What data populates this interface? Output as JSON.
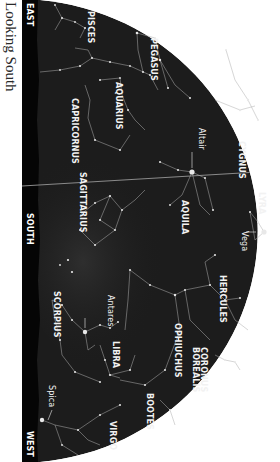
{
  "title": "Looking South",
  "colors": {
    "sky": "#1c1c1c",
    "horizon": "#050505",
    "lines": "#b9b9b9",
    "stars": "#e8e8e8",
    "labels": "#f2f2f2",
    "background": "#ffffff"
  },
  "directions": {
    "east": "EAST",
    "south": "SOUTH",
    "west": "WEST"
  },
  "constellations": {
    "pisces": "PISCES",
    "pegasus": "PEGASUS",
    "aquarius": "AQUARIUS",
    "capricornus": "CAPRICORNUS",
    "cygnus": "CYGNUS",
    "aquila": "AQUILA",
    "lyra": "LYRA",
    "sagittarius": "SAGITTARIUS",
    "hercules": "HERCULES",
    "ophiuchus": "OPHIUCHUS",
    "corona_line1": "CORONUS",
    "corona_line2": "BOREALIS",
    "scorpius": "SCORPIUS",
    "libra": "LIBRA",
    "bootes": "BOOTES",
    "virgo": "VIRGO"
  },
  "stars": {
    "altair": "Altair",
    "vega": "Vega",
    "antares": "Antares",
    "spica": "Spica"
  }
}
